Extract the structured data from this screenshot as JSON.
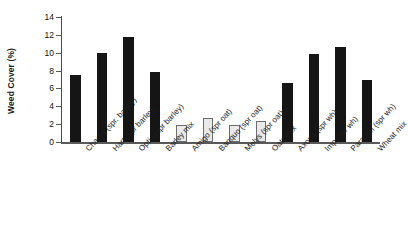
{
  "chart_data": {
    "type": "bar",
    "title": "",
    "subtitle": "",
    "xlabel": "",
    "ylabel": "Weed Cover (%)",
    "ylim": [
      0,
      14
    ],
    "ytick_step": 2,
    "yticks": [
      0,
      2,
      4,
      6,
      8,
      10,
      12,
      14
    ],
    "ytick_labels": [
      "0",
      "2",
      "4",
      "6",
      "8",
      "10",
      "12",
      "14"
    ],
    "grid": false,
    "legend": false,
    "legend_position": "none",
    "categories": [
      "Chariot (spr. barley)",
      "Hart (spr barley)",
      "Optic (spr barley)",
      "Barley mix",
      "Amigo (spr oat)",
      "Banquo (spr oat)",
      "Melys (spr oat)",
      "Oats mix",
      "Axona (spr wh)",
      "Imp (spr wh)",
      "Paragon (spr wh)",
      "Wheat mix"
    ],
    "values": [
      7.5,
      10.0,
      11.75,
      7.8,
      1.9,
      2.7,
      1.9,
      2.3,
      6.6,
      9.9,
      10.65,
      7.0
    ],
    "bar_styles": [
      "dark",
      "dark",
      "dark",
      "dark",
      "light",
      "light",
      "light",
      "light",
      "dark",
      "dark",
      "dark",
      "dark"
    ],
    "colors": {
      "dark_fill": "#151515",
      "light_fill": "#e9e9e9",
      "light_border": "#6e6e6e",
      "axis": "#5a5a5a",
      "text": "#1c1c1c"
    }
  }
}
